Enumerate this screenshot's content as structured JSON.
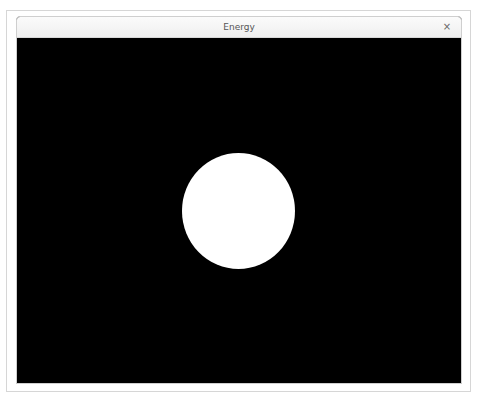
{
  "window": {
    "title": "Energy",
    "close_icon": "×"
  },
  "canvas": {
    "background_color": "#000000",
    "shape": {
      "type": "circle",
      "color": "#ffffff",
      "center_x": 238,
      "center_y": 211,
      "diameter": 114
    }
  }
}
